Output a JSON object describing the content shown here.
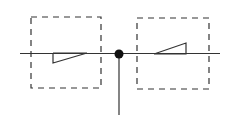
{
  "diagram": {
    "width": 240,
    "height": 123,
    "background": "#ffffff",
    "stroke_color": "#333333",
    "axis": {
      "x1": 20,
      "y1": 53.5,
      "x2": 220,
      "y2": 53.5
    },
    "pivot": {
      "cx": 119,
      "cy": 54,
      "r": 4.5,
      "fill": "#111111"
    },
    "stem": {
      "x1": 119,
      "y1": 54,
      "x2": 119,
      "y2": 115
    },
    "boxes": [
      {
        "name": "left-box",
        "x": 31,
        "y": 17,
        "w": 70,
        "h": 71
      },
      {
        "name": "right-box",
        "x": 137,
        "y": 18,
        "w": 72,
        "h": 71
      }
    ],
    "triangles": [
      {
        "name": "left-triangle",
        "points": "53,53 53,63 87,53"
      },
      {
        "name": "right-triangle",
        "points": "154,54 186,43 186,54"
      }
    ],
    "dash_pattern": "6,5"
  }
}
